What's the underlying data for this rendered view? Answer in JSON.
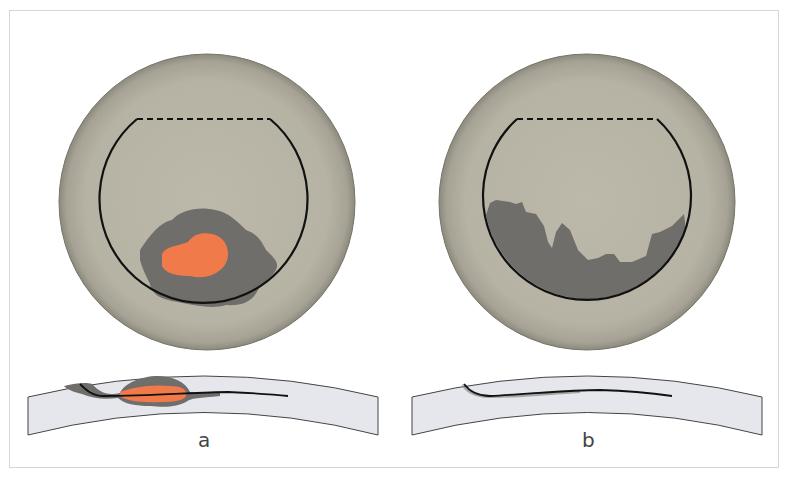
{
  "figure": {
    "panels": [
      {
        "id": "a",
        "label": "a",
        "description": "Circular view with central orange lesion surrounded by dark grey zone, and cross-section below showing orange lesion within grey layer"
      },
      {
        "id": "b",
        "label": "b",
        "description": "Circular view with dark grey irregular inferior area, and cross-section below showing thin grey layer"
      }
    ],
    "colors": {
      "disc": "#b8b5a6",
      "disc_edge": "#8f8c7f",
      "dark_zone": "#6f6e6b",
      "lesion": "#f07a4a",
      "cross_section": "#e6e7ec",
      "outline": "#111111",
      "frame": "#d6d6d2"
    }
  }
}
